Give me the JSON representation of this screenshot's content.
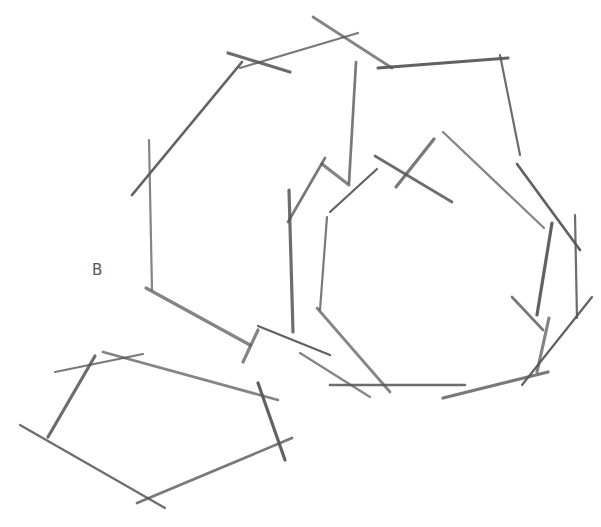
{
  "diagram": {
    "type": "pencil-sketch-polygons",
    "background": "#ffffff",
    "stroke_color": "#555555",
    "labels": [
      {
        "text": "B",
        "x": 92,
        "y": 276
      }
    ],
    "shapes": [
      {
        "name": "large-heptagon-top-left",
        "strokes": [
          [
            149,
            140,
            152,
            290
          ],
          [
            242,
            62,
            132,
            195
          ],
          [
            228,
            53,
            290,
            72
          ],
          [
            240,
            68,
            358,
            33
          ],
          [
            313,
            17,
            392,
            68
          ],
          [
            378,
            68,
            508,
            58
          ],
          [
            500,
            55,
            520,
            155
          ],
          [
            356,
            62,
            349,
            183
          ],
          [
            146,
            288,
            250,
            345
          ]
        ]
      },
      {
        "name": "inner-ring-right",
        "strokes": [
          [
            325,
            158,
            288,
            222
          ],
          [
            322,
            164,
            349,
            185
          ],
          [
            377,
            169,
            330,
            212
          ],
          [
            375,
            156,
            452,
            202
          ],
          [
            434,
            139,
            396,
            187
          ],
          [
            443,
            132,
            544,
            228
          ],
          [
            517,
            164,
            580,
            250
          ],
          [
            289,
            190,
            293,
            332
          ],
          [
            327,
            217,
            320,
            310
          ],
          [
            317,
            308,
            390,
            392
          ],
          [
            552,
            223,
            537,
            315
          ],
          [
            575,
            215,
            577,
            318
          ],
          [
            512,
            297,
            543,
            330
          ],
          [
            549,
            318,
            537,
            372
          ],
          [
            592,
            297,
            522,
            385
          ],
          [
            330,
            385,
            465,
            385
          ],
          [
            443,
            398,
            548,
            372
          ],
          [
            300,
            353,
            370,
            397
          ]
        ]
      },
      {
        "name": "pentagon-bottom-left",
        "strokes": [
          [
            95,
            356,
            48,
            437
          ],
          [
            55,
            372,
            143,
            354
          ],
          [
            103,
            352,
            278,
            400
          ],
          [
            258,
            383,
            285,
            460
          ],
          [
            20,
            425,
            165,
            508
          ],
          [
            137,
            503,
            292,
            438
          ],
          [
            258,
            330,
            243,
            362
          ],
          [
            258,
            326,
            330,
            355
          ]
        ]
      }
    ]
  }
}
